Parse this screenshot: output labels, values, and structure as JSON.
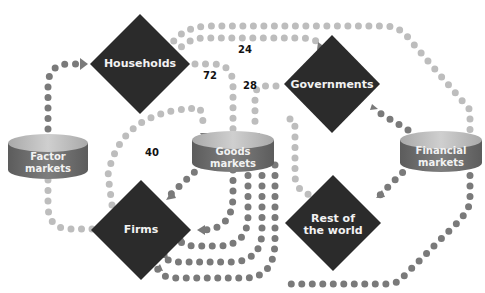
{
  "colors": {
    "diamond": "#2b2b2b",
    "cylinder_top": "#b8b8b8",
    "cylinder_side": "#6e6e6e",
    "dot_dark": "#7a7a7a",
    "dot_light": "#bdbdbd",
    "label_text": "#f2f2f2",
    "number_text": "#111111"
  },
  "nodes": {
    "households": {
      "label": "Households",
      "shape": "diamond"
    },
    "governments": {
      "label": "Governments",
      "shape": "diamond"
    },
    "firms": {
      "label": "Firms",
      "shape": "diamond"
    },
    "rest_of_world": {
      "label": "Rest of the world",
      "line1": "Rest of",
      "line2": "the world",
      "shape": "diamond"
    },
    "factor_markets": {
      "label": "Factor markets",
      "line1": "Factor",
      "line2": "markets",
      "shape": "cylinder"
    },
    "goods_markets": {
      "label": "Goods markets",
      "line1": "Goods",
      "line2": "markets",
      "shape": "cylinder"
    },
    "financial_markets": {
      "label": "Financial markets",
      "line1": "Financial",
      "line2": "markets",
      "shape": "cylinder"
    }
  },
  "flow_values": {
    "households_to_governments": "24",
    "households_to_goods": "72",
    "governments_to_goods": "28",
    "firms_to_goods": "40"
  }
}
